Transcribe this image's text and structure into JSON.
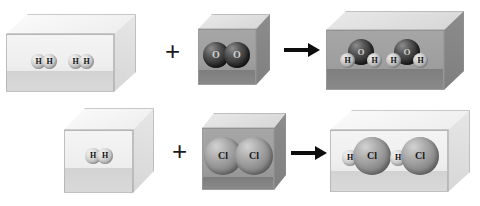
{
  "diagram": {
    "type": "chemical-reaction-particle-diagram",
    "rows": [
      {
        "id": "row-water",
        "equation": "2 H2 + O2 -> 2 H2O",
        "reactant_a": {
          "name": "hydrogen-gas-box",
          "container_style": "light",
          "molecules": [
            {
              "formula": "H2",
              "atoms": [
                {
                  "symbol": "H"
                },
                {
                  "symbol": "H"
                }
              ]
            },
            {
              "formula": "H2",
              "atoms": [
                {
                  "symbol": "H"
                },
                {
                  "symbol": "H"
                }
              ]
            }
          ]
        },
        "operator": "+",
        "reactant_b": {
          "name": "oxygen-gas-box",
          "container_style": "dark",
          "molecules": [
            {
              "formula": "O2",
              "atoms": [
                {
                  "symbol": "O"
                },
                {
                  "symbol": "O"
                }
              ]
            }
          ]
        },
        "arrow": "→",
        "product": {
          "name": "water-box",
          "container_style": "dark",
          "molecules": [
            {
              "formula": "H2O",
              "atoms": [
                {
                  "symbol": "O"
                },
                {
                  "symbol": "H"
                },
                {
                  "symbol": "H"
                }
              ]
            },
            {
              "formula": "H2O",
              "atoms": [
                {
                  "symbol": "O"
                },
                {
                  "symbol": "H"
                },
                {
                  "symbol": "H"
                }
              ]
            }
          ]
        }
      },
      {
        "id": "row-hydrogen-chloride",
        "equation": "H2 + Cl2 -> 2 HCl",
        "reactant_a": {
          "name": "hydrogen-gas-cube",
          "container_style": "light",
          "molecules": [
            {
              "formula": "H2",
              "atoms": [
                {
                  "symbol": "H"
                },
                {
                  "symbol": "H"
                }
              ]
            }
          ]
        },
        "operator": "+",
        "reactant_b": {
          "name": "chlorine-gas-cube",
          "container_style": "dark",
          "molecules": [
            {
              "formula": "Cl2",
              "atoms": [
                {
                  "symbol": "Cl"
                },
                {
                  "symbol": "Cl"
                }
              ]
            }
          ]
        },
        "arrow": "→",
        "product": {
          "name": "hydrogen-chloride-box",
          "container_style": "light",
          "molecules": [
            {
              "formula": "HCl",
              "atoms": [
                {
                  "symbol": "H"
                },
                {
                  "symbol": "Cl"
                }
              ]
            },
            {
              "formula": "HCl",
              "atoms": [
                {
                  "symbol": "H"
                },
                {
                  "symbol": "Cl"
                }
              ]
            }
          ]
        }
      }
    ],
    "labels": {
      "h": "H",
      "o": "O",
      "cl": "Cl",
      "plus": "+"
    },
    "colors": {
      "background": "#ffffff",
      "container_light": "#eeeeee",
      "container_dark": "#9e9e9e",
      "atom_h": "#d8d8d8",
      "atom_o": "#343434",
      "atom_cl": "#8a8a8a",
      "arrow": "#0d0d0d",
      "text": "#111111"
    }
  }
}
